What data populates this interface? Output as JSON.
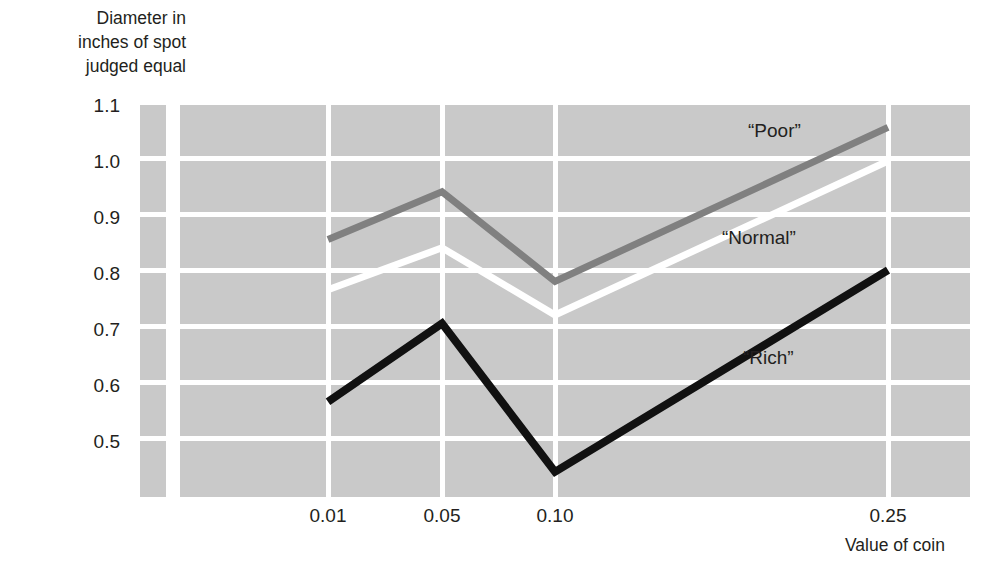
{
  "chart_data": {
    "type": "line",
    "title": "",
    "ylabel": "Diameter in\ninches of spot\njudged equal",
    "xlabel": "Value of coin",
    "categories": [
      "0.01",
      "0.05",
      "0.10",
      "0.25"
    ],
    "x_tick_labels": [
      "0.01",
      "0.05",
      "0.10",
      "0.25"
    ],
    "y_tick_labels": [
      "1.1",
      "1.0",
      "0.9",
      "0.8",
      "0.7",
      "0.6",
      "0.5"
    ],
    "ylim": [
      0.4,
      1.1
    ],
    "grid": "both-white-on-gray",
    "legend": "inline-labels",
    "series": [
      {
        "name": "“Poor”",
        "color": "#808080",
        "values": [
          0.86,
          0.945,
          0.785,
          1.06
        ]
      },
      {
        "name": "“Normal”",
        "color": "#ffffff",
        "values": [
          0.77,
          0.845,
          0.725,
          1.0
        ]
      },
      {
        "name": "“Rich”",
        "color": "#111111",
        "values": [
          0.57,
          0.71,
          0.445,
          0.805
        ]
      }
    ]
  },
  "axis": {
    "y_caption": "Diameter in\ninches of spot\njudged equal",
    "x_caption": "Value of coin",
    "y_ticks": [
      {
        "label": "1.1",
        "top": 96
      },
      {
        "label": "1.0",
        "top": 152
      },
      {
        "label": "0.9",
        "top": 208
      },
      {
        "label": "0.8",
        "top": 264
      },
      {
        "label": "0.7",
        "top": 320
      },
      {
        "label": "0.6",
        "top": 376
      },
      {
        "label": "0.5",
        "top": 432
      }
    ],
    "x_ticks": [
      {
        "label": "0.01",
        "left": 288
      },
      {
        "label": "0.05",
        "left": 402
      },
      {
        "label": "0.10",
        "left": 515
      },
      {
        "label": "0.25",
        "left": 848
      }
    ]
  },
  "series_labels": [
    {
      "text": "“Poor”",
      "left": 748,
      "top": 121
    },
    {
      "text": "“Normal”",
      "left": 722,
      "top": 228
    },
    {
      "text": "“Rich”",
      "left": 743,
      "top": 348
    }
  ],
  "colors": {
    "panel": "#c9c9c9",
    "grid": "#ffffff",
    "poor": "#808080",
    "normal": "#ffffff",
    "rich": "#111111",
    "text": "#231f20"
  }
}
